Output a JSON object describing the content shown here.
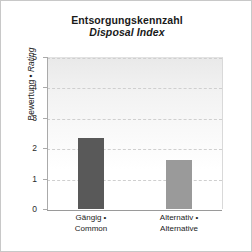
{
  "chart_data": {
    "type": "bar",
    "title": "Entsorgungskennzahl",
    "subtitle": "Disposal Index",
    "xlabel": "",
    "ylabel": "Bewertung • Rating",
    "ylabel_de": "Bewertung •",
    "ylabel_en": "Rating",
    "ylim": [
      0,
      5
    ],
    "yticks": [
      0,
      1,
      2,
      3,
      4,
      5
    ],
    "ytick_labels": [
      "0",
      "1",
      "2",
      "3",
      "4",
      "5"
    ],
    "grid": true,
    "legend": "none",
    "categories": [
      "Gängig • Common",
      "Alternativ • Alternative"
    ],
    "category_lines": [
      {
        "line1": "Gängig •",
        "line2": "Common"
      },
      {
        "line1": "Alternativ •",
        "line2": "Alternative"
      }
    ],
    "values": [
      2.33,
      1.62
    ],
    "bar_colors": [
      "#595959",
      "#9a9a9a"
    ]
  },
  "colors": {
    "frame_border": "#c8c8c8",
    "axis": "#aaaaaa",
    "gridline": "#cfcfcf",
    "text": "#1a1a1a",
    "plot_bg_top": "#e9e9e9",
    "plot_bg_bottom": "#ffffff"
  }
}
